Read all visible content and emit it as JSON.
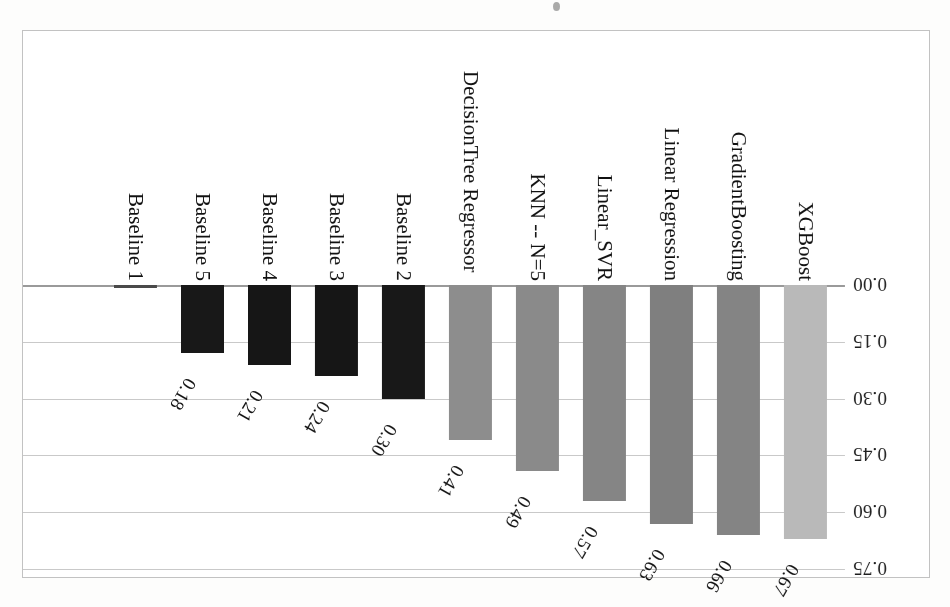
{
  "figure": {
    "kind": "scanned-bar-chart",
    "orientation_note": "page scanned upside-down (180°)",
    "frame_color": "#c2c2c2",
    "background": "#ffffff"
  },
  "chart_data": {
    "type": "bar",
    "title": "",
    "subtitle": "",
    "xlabel": "",
    "ylabel": "",
    "ylim": [
      0,
      0.75
    ],
    "grid": true,
    "legend": "none",
    "tick_labels": [
      "0.00",
      "0.15",
      "0.30",
      "0.45",
      "0.60",
      "0.75"
    ],
    "tick_values": [
      0.0,
      0.15,
      0.3,
      0.45,
      0.6,
      0.75
    ],
    "categories": [
      "XGBoost",
      "GradientBoosting",
      "Linear Regression",
      "Linear_SVR",
      "KNN -- N=5",
      "DecisionTree Regressor",
      "Baseline 2",
      "Baseline 3",
      "Baseline 4",
      "Baseline 5",
      "Baseline 1"
    ],
    "values": [
      0.67,
      0.66,
      0.63,
      0.57,
      0.49,
      0.41,
      0.3,
      0.24,
      0.21,
      0.18,
      0.0
    ],
    "value_labels": [
      "0.67",
      "0.66",
      "0.63",
      "0.57",
      "0.49",
      "0.41",
      "0.30",
      "0.24",
      "0.21",
      "0.18",
      ""
    ],
    "bar_colors": [
      "#b9b9b9",
      "#848484",
      "#7f7f7f",
      "#858585",
      "#8a8a8a",
      "#8d8d8d",
      "#181818",
      "#161616",
      "#161616",
      "#181818",
      "#4a4a4a"
    ],
    "series": [
      {
        "name": "score",
        "values": [
          0.67,
          0.66,
          0.63,
          0.57,
          0.49,
          0.41,
          0.3,
          0.24,
          0.21,
          0.18,
          0.0
        ]
      }
    ]
  }
}
